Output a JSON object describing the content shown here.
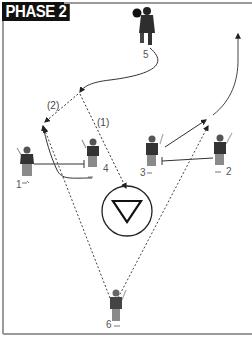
{
  "title": "PHASE 2",
  "colors": {
    "label_bg": "#111111",
    "label_text": "#ffffff",
    "border": "#9a9a9a",
    "line": "#333333",
    "player_body": "#3a3a3a",
    "player_legs": "#8a8a8a"
  },
  "players": [
    {
      "number": "1",
      "position": "left-wing"
    },
    {
      "number": "2",
      "position": "right-wing"
    },
    {
      "number": "3",
      "position": "right-center"
    },
    {
      "number": "4",
      "position": "left-center"
    },
    {
      "number": "5",
      "position": "top-with-ball"
    },
    {
      "number": "6",
      "position": "bottom"
    }
  ],
  "pass_labels": {
    "pass_1": "(1)",
    "pass_2": "(2)"
  },
  "goal_symbol": "inverted-triangle-in-circle"
}
